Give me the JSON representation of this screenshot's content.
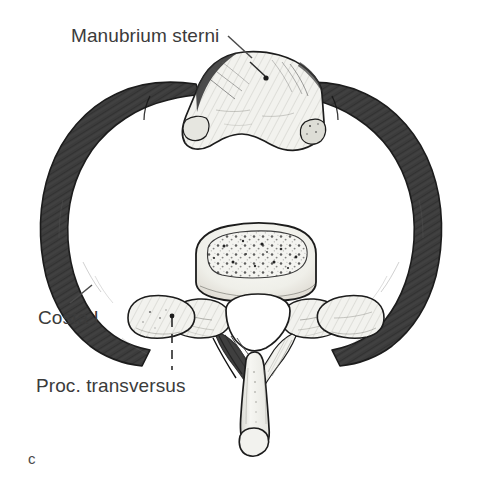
{
  "figure": {
    "letter": "c",
    "background_color": "#ffffff",
    "width": 482,
    "height": 485
  },
  "labels": [
    {
      "id": "manubrium",
      "text": "Manubrium sterni",
      "leader": "diagonal-line-with-dot",
      "target": "manubrium-sterni"
    },
    {
      "id": "costa",
      "text": "Costa I",
      "leader": "diagonal-line",
      "target": "first-rib-left"
    },
    {
      "id": "proc",
      "text": "Proc. transversus",
      "leader": "dashed-vertical-line-with-dot",
      "target": "transverse-process-left"
    }
  ],
  "colors": {
    "rib_dark": "#3c3c3c",
    "rib_dark_edge": "#2a2a2a",
    "bone_light": "#f2f2ee",
    "bone_shade": "#d8d8d2",
    "outline": "#1c1c1c",
    "text": "#3b3b3b",
    "leader_line": "#4a4a4a",
    "background": "#ffffff"
  },
  "structures": [
    {
      "name": "manubrium-sterni",
      "tone": "light-hatched"
    },
    {
      "name": "first-rib-left",
      "tone": "dark-solid"
    },
    {
      "name": "first-rib-right",
      "tone": "dark-solid"
    },
    {
      "name": "costal-cartilage-junction-left",
      "tone": "dark-solid"
    },
    {
      "name": "costal-cartilage-junction-right",
      "tone": "dark-solid"
    },
    {
      "name": "vertebral-body",
      "tone": "light-trabecular"
    },
    {
      "name": "vertebral-foramen",
      "tone": "white-opening"
    },
    {
      "name": "transverse-process-left",
      "tone": "light-hatched"
    },
    {
      "name": "transverse-process-right",
      "tone": "light-hatched"
    },
    {
      "name": "superior-articular-process-left",
      "tone": "light-hatched"
    },
    {
      "name": "superior-articular-process-right",
      "tone": "light-hatched"
    },
    {
      "name": "spinous-process",
      "tone": "light-hatched"
    },
    {
      "name": "lamina-left",
      "tone": "light-hatched"
    },
    {
      "name": "lamina-right",
      "tone": "light-hatched"
    }
  ]
}
